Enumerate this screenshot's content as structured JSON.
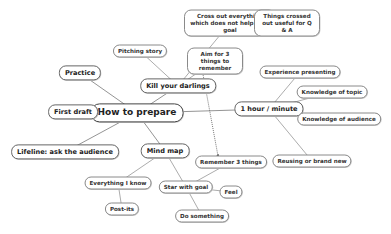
{
  "diagram": {
    "type": "mind-map",
    "root": "How to prepare",
    "nodes": [
      {
        "id": "root",
        "label": "How to prepare",
        "level": 0
      },
      {
        "id": "first-draft",
        "label": "First draft",
        "level": 1,
        "parent": "root"
      },
      {
        "id": "practice",
        "label": "Practice",
        "level": 1,
        "parent": "root"
      },
      {
        "id": "lifeline",
        "label": "Lifeline: ask the audience",
        "level": 1,
        "parent": "root"
      },
      {
        "id": "kill-darlings",
        "label": "Kill your darlings",
        "level": 1,
        "parent": "root"
      },
      {
        "id": "hour-minute",
        "label": "1 hour / minute",
        "level": 1,
        "parent": "root"
      },
      {
        "id": "mind-map",
        "label": "Mind map",
        "level": 1,
        "parent": "root"
      },
      {
        "id": "pitching-story",
        "label": "Pitching story",
        "level": 2,
        "parent": "kill-darlings"
      },
      {
        "id": "cross-out",
        "label": "Cross out everything which does not help your goal",
        "level": 2,
        "parent": "kill-darlings"
      },
      {
        "id": "crossed-out-useful",
        "label": "Things crossed out useful for Q & A",
        "level": 3,
        "parent": "cross-out"
      },
      {
        "id": "aim-3",
        "label": "Aim for 3 things to remember",
        "level": 2,
        "parent": "kill-darlings"
      },
      {
        "id": "experience",
        "label": "Experience presenting",
        "level": 2,
        "parent": "hour-minute"
      },
      {
        "id": "know-topic",
        "label": "Knowledge of topic",
        "level": 2,
        "parent": "hour-minute"
      },
      {
        "id": "know-audience",
        "label": "Knowledge of audience",
        "level": 2,
        "parent": "hour-minute"
      },
      {
        "id": "reusing",
        "label": "Reusing or brand new",
        "level": 2,
        "parent": "hour-minute"
      },
      {
        "id": "everything-i-know",
        "label": "Everything I know",
        "level": 2,
        "parent": "mind-map"
      },
      {
        "id": "post-its",
        "label": "Post-its",
        "level": 3,
        "parent": "everything-i-know"
      },
      {
        "id": "star-goal",
        "label": "Star with goal",
        "level": 2,
        "parent": "mind-map"
      },
      {
        "id": "remember-3",
        "label": "Remember 3 things",
        "level": 3,
        "parent": "star-goal"
      },
      {
        "id": "feel",
        "label": "Feel",
        "level": 3,
        "parent": "star-goal"
      },
      {
        "id": "do-something",
        "label": "Do something",
        "level": 3,
        "parent": "star-goal"
      }
    ],
    "cross_links": [
      {
        "from": "aim-3",
        "to": "remember-3",
        "style": "dotted-arrow"
      }
    ]
  }
}
